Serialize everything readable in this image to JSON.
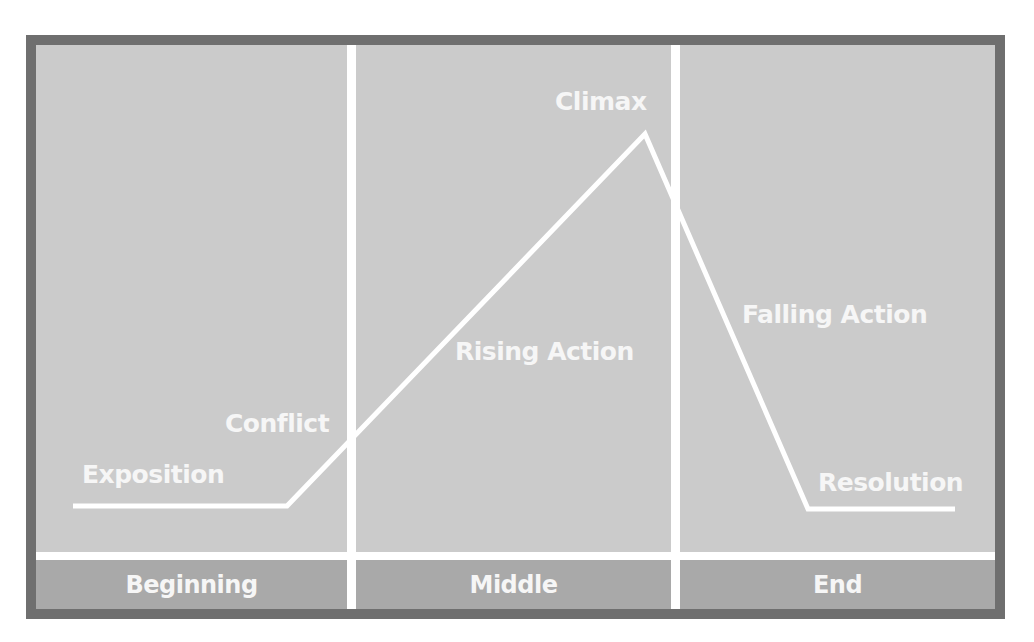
{
  "diagram": {
    "type": "plot-structure",
    "colors": {
      "border": "#6f6f6f",
      "background": "#cbcbcb",
      "section_band": "#a9a9a9",
      "line": "#ffffff",
      "text": "#f6f6f6"
    },
    "stages": [
      {
        "label": "Exposition"
      },
      {
        "label": "Conflict"
      },
      {
        "label": "Rising Action"
      },
      {
        "label": "Climax"
      },
      {
        "label": "Falling Action"
      },
      {
        "label": "Resolution"
      }
    ],
    "sections": [
      {
        "label": "Beginning"
      },
      {
        "label": "Middle"
      },
      {
        "label": "End"
      }
    ]
  }
}
